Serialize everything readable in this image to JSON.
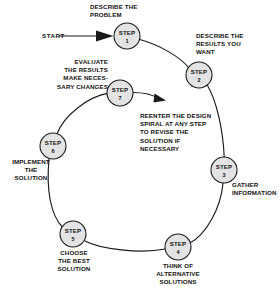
{
  "diagram": {
    "title": "The Design Spiral",
    "start_label": "START",
    "note": {
      "text": "REENTER THE DESIGN\nSPIRAL AT ANY STEP\nTO REVISE THE\nSOLUTION IF\nNECESSARY"
    },
    "colors": {
      "background": "#ffffff",
      "node_fill": "#e3e3e3",
      "stroke": "#1a1a1a",
      "text": "#141414"
    },
    "steps": [
      {
        "id": "step-1",
        "title": "STEP",
        "number": "1",
        "label": "DESCRIBE THE\nPROBLEM",
        "cx": 127,
        "cy": 36,
        "r": 13
      },
      {
        "id": "step-2",
        "title": "STEP",
        "number": "2",
        "label": "DESCRIBE THE\nRESULTS YOU\nWANT",
        "cx": 199,
        "cy": 75,
        "r": 13
      },
      {
        "id": "step-3",
        "title": "STEP",
        "number": "3",
        "label": "GATHER\nINFORMATION",
        "cx": 224,
        "cy": 170,
        "r": 13
      },
      {
        "id": "step-4",
        "title": "STEP",
        "number": "4",
        "label": "THINK OF\nALTERNATIVE\nSOLUTIONS",
        "cx": 178,
        "cy": 247,
        "r": 13
      },
      {
        "id": "step-5",
        "title": "STEP",
        "number": "5",
        "label": "CHOOSE\nTHE BEST\nSOLUTION",
        "cx": 73,
        "cy": 234,
        "r": 13
      },
      {
        "id": "step-6",
        "title": "STEP",
        "number": "6",
        "label": "IMPLEMENT\nTHE\nSOLUTION",
        "cx": 53,
        "cy": 146,
        "r": 13
      },
      {
        "id": "step-7",
        "title": "STEP",
        "number": "7",
        "label": "EVALUATE\nTHE RESULTS\nMAKE NECES-\nSARY CHANGES",
        "cx": 120,
        "cy": 93,
        "r": 13
      }
    ]
  }
}
